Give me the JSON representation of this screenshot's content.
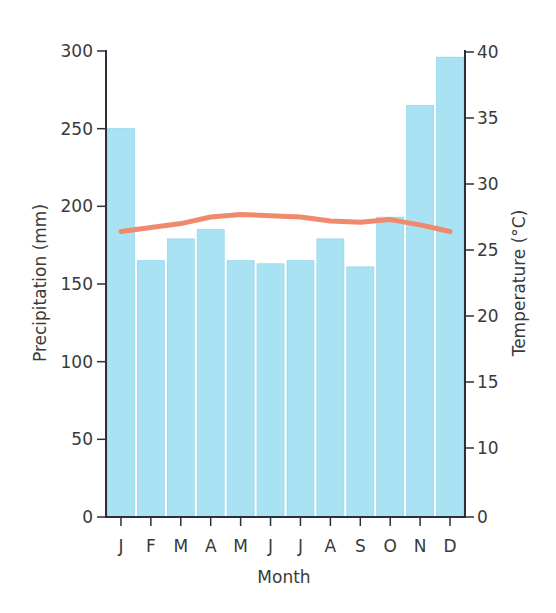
{
  "chart_data": {
    "type": "bar",
    "title": "",
    "categories": [
      "J",
      "F",
      "M",
      "A",
      "M",
      "J",
      "J",
      "A",
      "S",
      "O",
      "N",
      "D"
    ],
    "xlabel": "Month",
    "ylabel": "Precipitation (mm)",
    "y2label": "Temperature (°C)",
    "ylim": [
      0,
      300
    ],
    "yticks": [
      0,
      50,
      100,
      150,
      200,
      250,
      300
    ],
    "y2ticks": [
      0,
      10,
      15,
      20,
      25,
      30,
      35,
      40
    ],
    "grid": false,
    "legend": "none",
    "series": [
      {
        "name": "Precipitation (mm)",
        "type": "bar",
        "axis": "left",
        "color": "#a9e3f3",
        "values": [
          250,
          165,
          179,
          185,
          165,
          163,
          165,
          179,
          161,
          193,
          265,
          296
        ]
      },
      {
        "name": "Temperature (°C)",
        "type": "line",
        "axis": "right",
        "color": "#ef8a6c",
        "values": [
          26.4,
          26.7,
          27.0,
          27.5,
          27.7,
          27.6,
          27.5,
          27.2,
          27.1,
          27.3,
          26.9,
          26.4
        ]
      }
    ]
  }
}
